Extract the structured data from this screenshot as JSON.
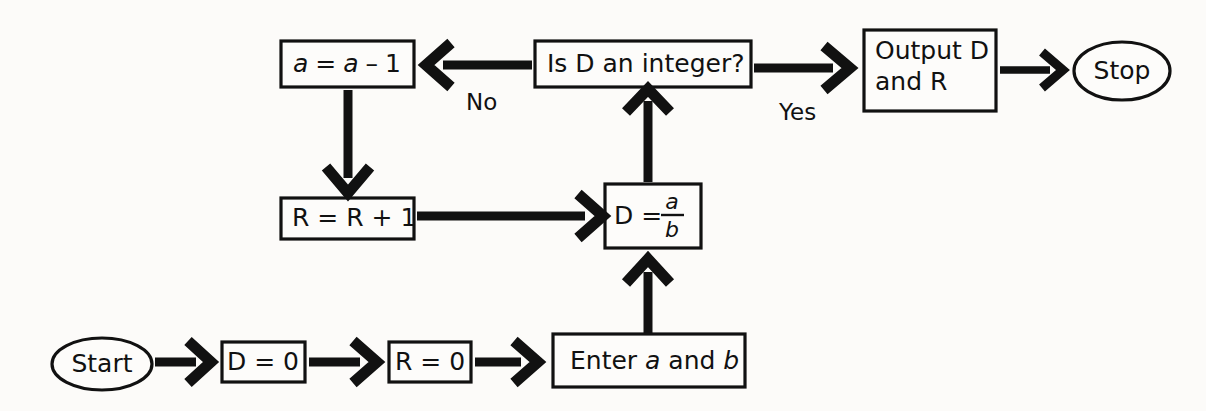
{
  "diagram": {
    "background_color": "#fcfbf9",
    "stroke_color": "#111111",
    "nodes": {
      "start": {
        "label": "Start",
        "shape": "ellipse"
      },
      "d_init": {
        "label": "D = 0",
        "shape": "rect"
      },
      "r_init": {
        "label": "R = 0",
        "shape": "rect"
      },
      "enter": {
        "label": "Enter a and b",
        "shape": "rect",
        "text_plain": "Enter ",
        "var_a": "a",
        "text_mid": " and ",
        "var_b": "b"
      },
      "divide": {
        "label": "D = a/b",
        "shape": "rect",
        "lhs": "D =",
        "numerator": "a",
        "denominator": "b"
      },
      "decision": {
        "label": "Is D an integer?",
        "shape": "rect"
      },
      "decrement": {
        "label": "a = a - 1",
        "shape": "rect",
        "var_a1": "a",
        "op_eq": "=",
        "var_a2": "a",
        "op_minus": "–",
        "num_one": "1"
      },
      "increment": {
        "label": "R = R + 1",
        "shape": "rect"
      },
      "output": {
        "label": "Output D and R",
        "shape": "rect",
        "line1": "Output D",
        "line2": "and R"
      },
      "stop": {
        "label": "Stop",
        "shape": "ellipse"
      }
    },
    "edge_labels": {
      "no": "No",
      "yes": "Yes"
    },
    "edges": [
      {
        "from": "start",
        "to": "d_init",
        "label": ""
      },
      {
        "from": "d_init",
        "to": "r_init",
        "label": ""
      },
      {
        "from": "r_init",
        "to": "enter",
        "label": ""
      },
      {
        "from": "enter",
        "to": "divide",
        "label": ""
      },
      {
        "from": "divide",
        "to": "decision",
        "label": ""
      },
      {
        "from": "decision",
        "to": "decrement",
        "label": "No"
      },
      {
        "from": "decision",
        "to": "output",
        "label": "Yes"
      },
      {
        "from": "decrement",
        "to": "increment",
        "label": ""
      },
      {
        "from": "increment",
        "to": "divide",
        "label": ""
      },
      {
        "from": "output",
        "to": "stop",
        "label": ""
      }
    ]
  }
}
